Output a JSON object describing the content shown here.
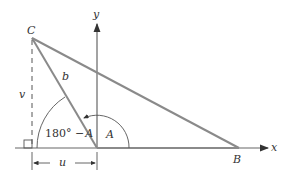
{
  "diagram": {
    "points": {
      "C": {
        "label": "C"
      },
      "A": {
        "label": "A"
      },
      "B": {
        "label": "B"
      }
    },
    "axes": {
      "x_label": "x",
      "y_label": "y"
    },
    "side_b": "b",
    "height_v": "v",
    "base_u": "u",
    "angle_A": "A",
    "angle_supp": {
      "prefix": "180° −",
      "var": "A"
    },
    "colors": {
      "triangle": "#8a8a8a",
      "axes": "#333333",
      "text": "#333333"
    }
  }
}
